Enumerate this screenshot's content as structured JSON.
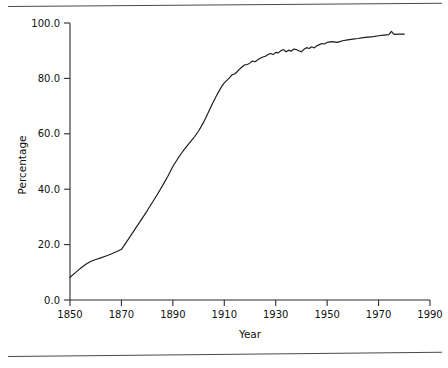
{
  "figure": {
    "background_color": "#ffffff",
    "line_color": "#1a1a1a",
    "axis_color": "#2b2b2b",
    "rule_color": "#4a4a4a",
    "top_rule_name": "page-rule-top",
    "bottom_rule_name": "page-rule-bottom"
  },
  "chart_data": {
    "type": "line",
    "title": "",
    "subtitle": "",
    "xlabel": "Year",
    "ylabel": "Percentage",
    "xlim": [
      1850,
      1990
    ],
    "ylim": [
      0.0,
      100.0
    ],
    "grid": false,
    "legend": false,
    "legend_position": "none",
    "xticks": [
      1850,
      1870,
      1890,
      1910,
      1930,
      1950,
      1970,
      1990
    ],
    "xtick_labels": [
      "1850",
      "1870",
      "1890",
      "1910",
      "1930",
      "1950",
      "1970",
      "1990"
    ],
    "yticks": [
      0.0,
      20.0,
      40.0,
      60.0,
      80.0,
      100.0
    ],
    "ytick_labels": [
      "0.0",
      "20.0",
      "40.0",
      "60.0",
      "80.0",
      "100.0"
    ],
    "series": [
      {
        "name": "Percentage",
        "x": [
          1850,
          1852,
          1854,
          1856,
          1858,
          1860,
          1862,
          1864,
          1866,
          1868,
          1870,
          1872,
          1874,
          1876,
          1878,
          1880,
          1882,
          1884,
          1886,
          1888,
          1890,
          1892,
          1894,
          1896,
          1898,
          1900,
          1901,
          1902,
          1903,
          1904,
          1905,
          1906,
          1907,
          1908,
          1909,
          1910,
          1911,
          1912,
          1913,
          1914,
          1915,
          1916,
          1917,
          1918,
          1919,
          1920,
          1921,
          1922,
          1923,
          1924,
          1925,
          1926,
          1927,
          1928,
          1929,
          1930,
          1931,
          1932,
          1933,
          1934,
          1935,
          1936,
          1937,
          1938,
          1939,
          1940,
          1941,
          1942,
          1943,
          1944,
          1945,
          1946,
          1947,
          1948,
          1949,
          1950,
          1952,
          1954,
          1956,
          1958,
          1960,
          1962,
          1964,
          1966,
          1968,
          1970,
          1972,
          1974,
          1975,
          1976,
          1978,
          1980
        ],
        "y": [
          8.2,
          9.8,
          11.4,
          12.8,
          13.9,
          14.6,
          15.2,
          15.9,
          16.6,
          17.4,
          18.3,
          21.0,
          23.8,
          26.6,
          29.4,
          32.2,
          35.2,
          38.2,
          41.3,
          44.6,
          48.2,
          51.2,
          53.8,
          56.2,
          58.4,
          61.0,
          62.6,
          64.3,
          66.2,
          68.1,
          70.1,
          72.0,
          73.8,
          75.5,
          77.1,
          78.4,
          79.3,
          80.2,
          81.3,
          81.6,
          82.4,
          83.4,
          84.2,
          84.9,
          85.0,
          85.6,
          86.3,
          86.0,
          86.7,
          87.3,
          87.7,
          88.0,
          88.6,
          89.0,
          88.6,
          89.4,
          89.2,
          90.0,
          90.4,
          89.6,
          90.2,
          89.8,
          90.6,
          90.4,
          90.0,
          89.6,
          90.5,
          91.1,
          90.8,
          91.4,
          91.0,
          91.8,
          92.2,
          92.6,
          92.4,
          93.0,
          93.3,
          93.0,
          93.6,
          93.9,
          94.2,
          94.4,
          94.7,
          94.9,
          95.1,
          95.4,
          95.6,
          95.8,
          97.0,
          95.9,
          96.0,
          96.0
        ]
      }
    ]
  }
}
